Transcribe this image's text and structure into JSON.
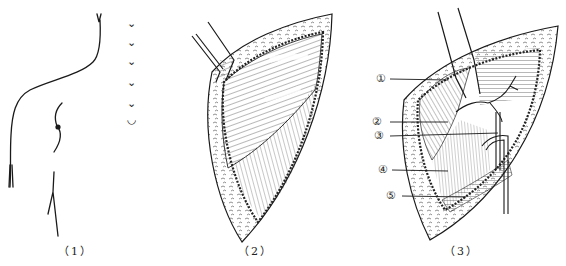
{
  "figure": {
    "panels": [
      {
        "id": "1",
        "caption": "（1）",
        "subject": "torso-outline-incision-marks"
      },
      {
        "id": "2",
        "caption": "（2）",
        "subject": "surgical-field-retracted-muscle"
      },
      {
        "id": "3",
        "caption": "（3）",
        "subject": "surgical-field-labeled-structures"
      }
    ],
    "panel3_labels": [
      "①",
      "②",
      "③",
      "④",
      "⑤"
    ],
    "incision_marks": [
      "⌄",
      "⌄",
      "⌄",
      "⌄",
      "⌄",
      "◡"
    ],
    "colors": {
      "ink": "#1a1a1a",
      "background": "#ffffff"
    }
  }
}
